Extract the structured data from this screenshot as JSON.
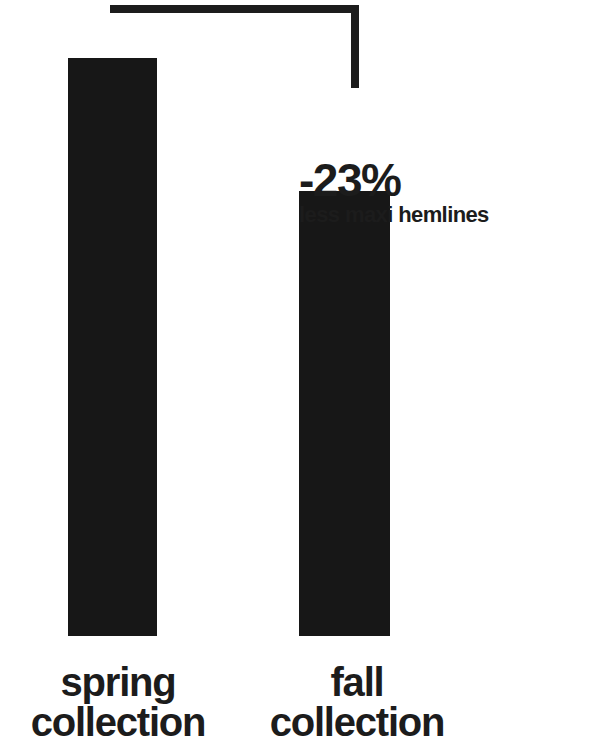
{
  "canvas": {
    "width": 607,
    "height": 742,
    "background": "#ffffff",
    "ink_color": "#1c1c1c"
  },
  "callout": {
    "value": "-23%",
    "note": "less maxi hemlines"
  },
  "labels": {
    "spring": {
      "line1": "spring",
      "line2": "collection"
    },
    "fall": {
      "line1": "fall",
      "line2": "collection"
    }
  },
  "chart_data": {
    "type": "bar",
    "title": "",
    "subtitle": "",
    "xlabel": "",
    "ylabel": "",
    "categories": [
      "spring collection",
      "fall collection"
    ],
    "values": [
      100,
      77
    ],
    "value_unit": "relative index (spring = 100)",
    "ylim": [
      0,
      100
    ],
    "grid": false,
    "legend": false,
    "bar_color": "#171717",
    "annotations": [
      {
        "text": "-23%",
        "subtext": "less maxi hemlines",
        "from_category": "spring collection",
        "to_category": "fall collection",
        "change_percent": -23,
        "connector": "bracket"
      }
    ]
  }
}
